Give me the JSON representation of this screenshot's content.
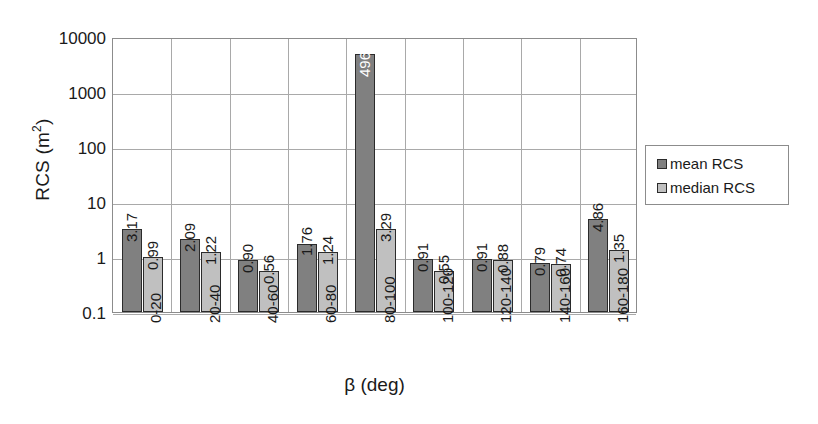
{
  "chart_data": {
    "type": "bar",
    "title": "",
    "subtitle": "",
    "xlabel": "β (deg)",
    "ylabel": "RCS (m²)",
    "ylabel_base": "RCS (m",
    "ylabel_sup": "2",
    "ylabel_close": ")",
    "yscale": "log",
    "ylim": [
      0.1,
      10000
    ],
    "ytick_labels": [
      "10000",
      "1000",
      "100",
      "10",
      "1",
      "0.1"
    ],
    "ytick_values": [
      10000,
      1000,
      100,
      10,
      1,
      0.1
    ],
    "grid": "both",
    "legend_position": "right",
    "categories": [
      "0-20",
      "20-40",
      "40-60",
      "60-80",
      "80-100",
      "100-120",
      "120-140",
      "140-160",
      "160-180"
    ],
    "series": [
      {
        "name": "mean RCS",
        "color": "#808080",
        "values": [
          3.17,
          2.09,
          0.9,
          1.76,
          4965,
          0.91,
          0.91,
          0.79,
          4.86
        ],
        "labels": [
          "3.17",
          "2.09",
          "0.90",
          "1.76",
          "4965",
          "0.91",
          "0.91",
          "0.79",
          "4.86"
        ]
      },
      {
        "name": "median RCS",
        "color": "#c0c0c0",
        "values": [
          0.99,
          1.22,
          0.56,
          1.24,
          3.29,
          0.55,
          0.88,
          0.74,
          1.35
        ],
        "labels": [
          "0.99",
          "1.22",
          "0.56",
          "1.24",
          "3.29",
          "0.55",
          "0.88",
          "0.74",
          "1.35"
        ]
      }
    ]
  },
  "legend": {
    "items": [
      {
        "label": "mean RCS",
        "color": "#808080"
      },
      {
        "label": "median RCS",
        "color": "#c0c0c0"
      }
    ]
  },
  "colors": {
    "mean_series": "#808080",
    "median_series": "#c0c0c0",
    "bar_outline": "#2b2b2b",
    "gridline": "#a9a9a9",
    "axis_line": "#8c8c8c",
    "background": "#ffffff",
    "text": "#1a1a1a",
    "inside_label_text": "#ffffff"
  }
}
